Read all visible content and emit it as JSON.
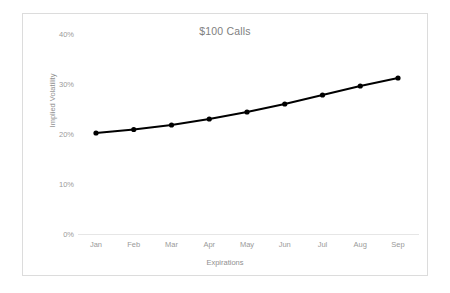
{
  "chart_data": {
    "type": "line",
    "title": "$100 Calls",
    "xlabel": "Expirations",
    "ylabel": "Implied Volatility",
    "categories": [
      "Jan",
      "Feb",
      "Mar",
      "Apr",
      "May",
      "Jun",
      "Jul",
      "Aug",
      "Sep"
    ],
    "series": [
      {
        "name": "Implied Volatility",
        "values": [
          20.2,
          20.9,
          21.8,
          23.0,
          24.4,
          26.0,
          27.8,
          29.6,
          31.2
        ],
        "color": "#000000",
        "marker": "circle"
      }
    ],
    "ylim": [
      0,
      40
    ],
    "yticks": [
      0,
      10,
      20,
      30,
      40
    ],
    "ytick_labels": [
      "0%",
      "10%",
      "20%",
      "30%",
      "40%"
    ],
    "grid": false,
    "legend": "none",
    "value_suffix": "%"
  },
  "colors": {
    "series_line": "#000000",
    "axis_line": "#e6e6e6",
    "tick_text": "#9a9a9a",
    "title_text": "#808080",
    "frame_border": "#dcdcdc",
    "background": "#ffffff"
  }
}
